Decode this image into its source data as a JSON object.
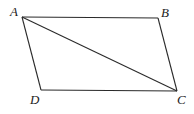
{
  "diagram": {
    "type": "parallelogram-with-diagonal",
    "vertices": [
      {
        "id": "A",
        "label": "A",
        "x": 22,
        "y": 17,
        "label_x": 10,
        "label_y": 16
      },
      {
        "id": "B",
        "label": "B",
        "x": 158,
        "y": 18,
        "label_x": 161,
        "label_y": 17
      },
      {
        "id": "C",
        "label": "C",
        "x": 177,
        "y": 91,
        "label_x": 177,
        "label_y": 104
      },
      {
        "id": "D",
        "label": "D",
        "x": 41,
        "y": 90,
        "label_x": 30,
        "label_y": 104
      }
    ],
    "edges": [
      {
        "from": "A",
        "to": "B"
      },
      {
        "from": "B",
        "to": "C"
      },
      {
        "from": "C",
        "to": "D"
      },
      {
        "from": "D",
        "to": "A"
      },
      {
        "from": "A",
        "to": "C",
        "kind": "diagonal"
      }
    ],
    "colors": {
      "stroke": "#2a2a2a",
      "label": "#222222",
      "background": "#ffffff"
    }
  }
}
